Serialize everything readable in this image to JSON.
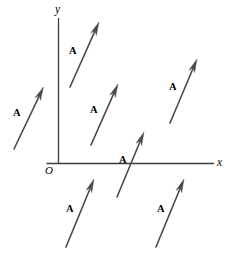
{
  "figure": {
    "background_color": "#ffffff",
    "line_color": "#4a4a4a",
    "axis_color": "#3c3c3c",
    "text_color": "#2e2e2e",
    "width": 234,
    "height": 255
  },
  "axes": {
    "y_axis": {
      "label": "y",
      "label_x": 55,
      "label_y": 14,
      "x": 58.5,
      "y_top": 18,
      "y_bottom": 163.5
    },
    "x_axis": {
      "label": "x",
      "label_x": 217,
      "label_y": 167,
      "y": 163.5,
      "x_left": 58.5,
      "x_right": 214
    },
    "origin": {
      "label": "O",
      "label_x": 45,
      "label_y": 175
    }
  },
  "chart_data": {
    "type": "scatter",
    "xlabel": "x",
    "ylabel": "y",
    "vector_label": "A",
    "vectors": [
      {
        "id": "vector-left-upper",
        "label": "A",
        "tail_x": 14,
        "tail_y": 149,
        "tip_x": 43.5,
        "tip_y": 87,
        "label_x": 13,
        "label_y": 118
      },
      {
        "id": "vector-top-inner",
        "label": "A",
        "tail_x": 70,
        "tail_y": 87,
        "tip_x": 99,
        "tip_y": 22,
        "label_x": 69,
        "label_y": 56
      },
      {
        "id": "vector-middle-inner",
        "label": "A",
        "tail_x": 91,
        "tail_y": 145,
        "tip_x": 118,
        "tip_y": 84,
        "label_x": 90,
        "label_y": 115
      },
      {
        "id": "vector-right-upper",
        "label": "A",
        "tail_x": 170,
        "tail_y": 123,
        "tip_x": 197,
        "tip_y": 59,
        "label_x": 169,
        "label_y": 92
      },
      {
        "id": "vector-axis-crossing",
        "label": "A",
        "tail_x": 117,
        "tail_y": 197,
        "tip_x": 144,
        "tip_y": 132,
        "label_x": 119,
        "label_y": 165
      },
      {
        "id": "vector-bottom-left",
        "label": "A",
        "tail_x": 66,
        "tail_y": 247,
        "tip_x": 94,
        "tip_y": 179,
        "label_x": 66,
        "label_y": 214
      },
      {
        "id": "vector-bottom-right",
        "label": "A",
        "tail_x": 156,
        "tail_y": 247,
        "tip_x": 184,
        "tip_y": 179,
        "label_x": 157,
        "label_y": 214
      }
    ],
    "grid": false,
    "legend": false
  }
}
